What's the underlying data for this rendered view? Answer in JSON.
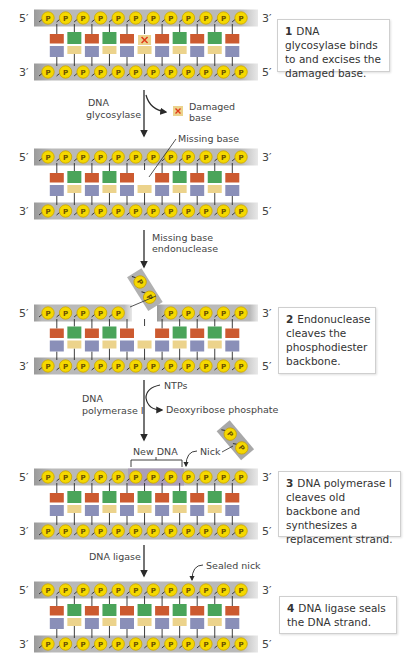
{
  "colors": {
    "backbone": "#b8b8b8",
    "backbone_new": "#a89ab8",
    "phosphate_fill": "#f5d800",
    "phosphate_stroke": "#c9a400",
    "base_red": "#cc5a30",
    "base_green": "#4aa45a",
    "base_blue": "#8a8fb8",
    "base_yellow": "#ecd38c",
    "damage_x": "#e03a1a",
    "line": "#2a2a2a"
  },
  "phosphate_label": "P",
  "strands": [
    {
      "id": "initial",
      "top_5": "5′",
      "top_3": "3′",
      "bot_3": "3′",
      "bot_5": "5′",
      "top_bases": [
        "red",
        "green",
        "red",
        "green",
        "red",
        "damaged",
        "red",
        "green",
        "red",
        "green",
        "red"
      ],
      "bot_bases": [
        "blue",
        "yellow",
        "blue",
        "yellow",
        "blue",
        "yellow",
        "blue",
        "yellow",
        "blue",
        "yellow",
        "blue"
      ]
    },
    {
      "id": "abasic",
      "top_5": "5′",
      "top_3": "3′",
      "bot_3": "3′",
      "bot_5": "5′",
      "top_bases": [
        "red",
        "green",
        "red",
        "green",
        "red",
        "missing",
        "red",
        "green",
        "red",
        "green",
        "red"
      ],
      "bot_bases": [
        "blue",
        "yellow",
        "blue",
        "yellow",
        "blue",
        "yellow",
        "blue",
        "yellow",
        "blue",
        "yellow",
        "blue"
      ]
    },
    {
      "id": "cleaved",
      "top_5": "5′",
      "top_3": "3′",
      "bot_3": "3′",
      "bot_5": "5′",
      "top_bases": [
        "red",
        "green",
        "red",
        "green",
        "red",
        "missing",
        "red",
        "green",
        "red",
        "green",
        "red"
      ],
      "bot_bases": [
        "blue",
        "yellow",
        "blue",
        "yellow",
        "blue",
        "yellow",
        "blue",
        "yellow",
        "blue",
        "yellow",
        "blue"
      ]
    },
    {
      "id": "repaired-nicked",
      "top_5": "5′",
      "top_3": "3′",
      "bot_3": "3′",
      "bot_5": "5′",
      "top_bases": [
        "red",
        "green",
        "red",
        "green",
        "red",
        "green",
        "red",
        "green",
        "red",
        "green",
        "red"
      ],
      "bot_bases": [
        "blue",
        "yellow",
        "blue",
        "yellow",
        "blue",
        "yellow",
        "blue",
        "yellow",
        "blue",
        "yellow",
        "blue"
      ]
    },
    {
      "id": "sealed",
      "top_5": "5′",
      "top_3": "3′",
      "bot_3": "3′",
      "bot_5": "5′",
      "top_bases": [
        "red",
        "green",
        "red",
        "green",
        "red",
        "green",
        "red",
        "green",
        "red",
        "green",
        "red"
      ],
      "bot_bases": [
        "blue",
        "yellow",
        "blue",
        "yellow",
        "blue",
        "yellow",
        "blue",
        "yellow",
        "blue",
        "yellow",
        "blue"
      ]
    }
  ],
  "annotations": {
    "enzyme_1_line1": "DNA",
    "enzyme_1_line2": "glycosylase",
    "damaged_base_line1": "Damaged",
    "damaged_base_line2": "base",
    "missing_base": "Missing base",
    "enzyme_2_line1": "Missing base",
    "enzyme_2_line2": "endonuclease",
    "ntps": "NTPs",
    "enzyme_3_line1": "DNA",
    "enzyme_3_line2": "polymerase I",
    "deoxyribose_phosphate": "Deoxyribose phosphate",
    "new_dna": "New DNA",
    "nick": "Nick",
    "enzyme_4": "DNA ligase",
    "sealed_nick": "Sealed nick"
  },
  "steps": [
    {
      "number": "1",
      "text": "DNA glycosylase binds to and excises the damaged base."
    },
    {
      "number": "2",
      "text": "Endonuclease cleaves the phosphodiester backbone."
    },
    {
      "number": "3",
      "text": "DNA polymerase I cleaves old backbone and synthesizes a replacement strand."
    },
    {
      "number": "4",
      "text": "DNA ligase seals the DNA strand."
    }
  ]
}
